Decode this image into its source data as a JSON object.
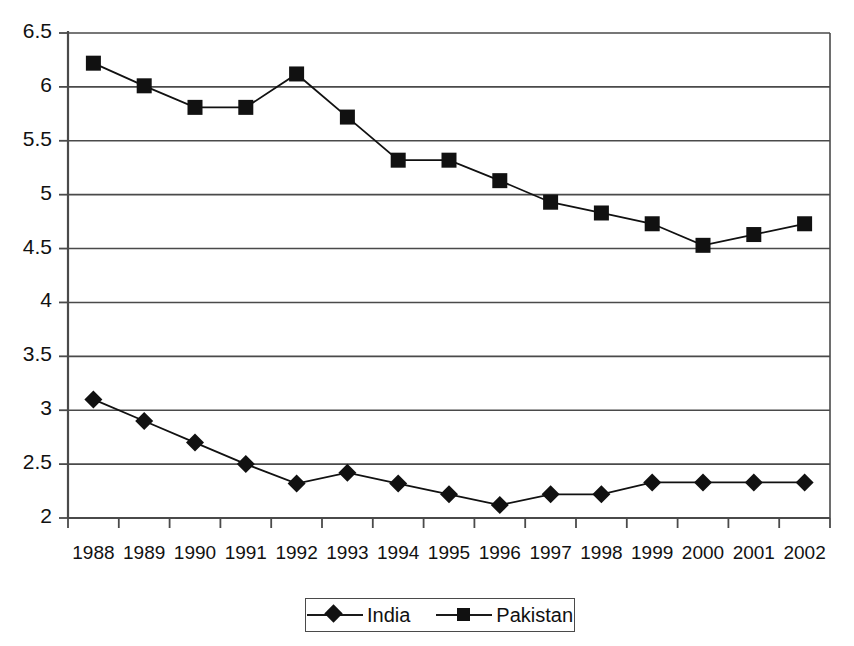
{
  "chart_data": {
    "type": "line",
    "title": "",
    "subtitle": "",
    "xlabel": "",
    "ylabel": "",
    "categories": [
      "1988",
      "1989",
      "1990",
      "1991",
      "1992",
      "1993",
      "1994",
      "1995",
      "1996",
      "1997",
      "1998",
      "1999",
      "2000",
      "2001",
      "2002"
    ],
    "ylim": [
      2,
      6.5
    ],
    "yticks": [
      "2",
      "2.5",
      "3",
      "3.5",
      "4",
      "4.5",
      "5",
      "5.5",
      "6",
      "6.5"
    ],
    "ytick_values": [
      2,
      2.5,
      3,
      3.5,
      4,
      4.5,
      5,
      5.5,
      6,
      6.5
    ],
    "grid": true,
    "grid_axis": "y",
    "legend_position": "bottom",
    "series": [
      {
        "name": "India",
        "marker": "diamond",
        "color": "#111111",
        "values": [
          3.1,
          2.9,
          2.7,
          2.5,
          2.32,
          2.42,
          2.32,
          2.22,
          2.12,
          2.22,
          2.22,
          2.33,
          2.33,
          2.33,
          2.33
        ]
      },
      {
        "name": "Pakistan",
        "marker": "square",
        "color": "#111111",
        "values": [
          6.22,
          6.01,
          5.81,
          5.81,
          6.12,
          5.72,
          5.32,
          5.32,
          5.13,
          4.93,
          4.83,
          4.73,
          4.53,
          4.63,
          4.73
        ]
      }
    ]
  },
  "legend": {
    "entries": [
      {
        "label": "India"
      },
      {
        "label": "Pakistan"
      }
    ]
  },
  "colors": {
    "series_ink": "#111111",
    "axis": "#4a4a4a",
    "grid": "#4a4a4a",
    "background": "#ffffff"
  }
}
